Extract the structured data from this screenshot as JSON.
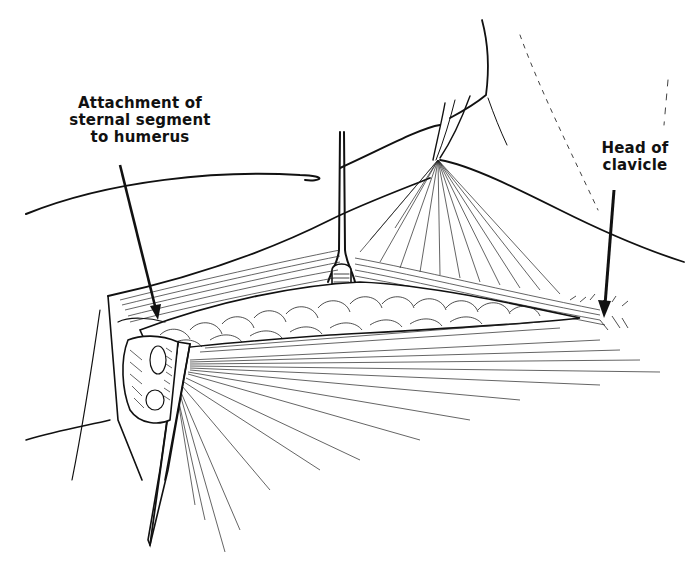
{
  "figure": {
    "type": "surgical anatomical line illustration",
    "background_color": "#ffffff",
    "ink_color": "#111111",
    "labels": [
      {
        "id": "attachment",
        "lines": [
          "Attachment of",
          "sternal segment",
          "to humerus"
        ],
        "pointer": {
          "from": [
            120,
            165
          ],
          "to": [
            158,
            318
          ]
        }
      },
      {
        "id": "clavicle",
        "lines": [
          "Head of",
          "clavicle"
        ],
        "pointer": {
          "from": [
            614,
            190
          ],
          "to": [
            604,
            318
          ]
        }
      }
    ],
    "depicted_elements": [
      "retracted skin flap (upper)",
      "retracted skin flap (lower)",
      "forked retractor (center)",
      "hook retractor (upper right)",
      "pectoralis muscle fibers",
      "sternal segment muscle bundle",
      "clavicular muscle fan",
      "blunt retractor (lower left)"
    ]
  }
}
